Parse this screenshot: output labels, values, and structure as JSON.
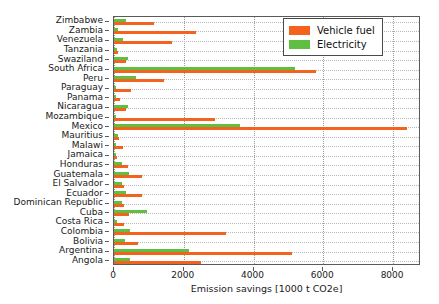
{
  "chart_data": {
    "type": "bar",
    "orientation": "horizontal",
    "title": "",
    "xlabel": "Emission savings [1000 t CO2e]",
    "ylabel": "",
    "xlim": [
      0,
      8800
    ],
    "xticks": [
      0,
      2000,
      4000,
      6000,
      8000
    ],
    "xtick_labels": [
      "0",
      "2000",
      "4000",
      "6000",
      "8000"
    ],
    "grid": true,
    "legend_position": "top-right",
    "categories": [
      "Zimbabwe",
      "Zambia",
      "Venezuela",
      "Tanzania",
      "Swaziland",
      "South Africa",
      "Peru",
      "Paraguay",
      "Panama",
      "Nicaragua",
      "Mozambique",
      "Mexico",
      "Mauritius",
      "Malawi",
      "Jamaica",
      "Honduras",
      "Guatemala",
      "El Salvador",
      "Ecuador",
      "Dominican Republic",
      "Cuba",
      "Costa Rica",
      "Colombia",
      "Bolivia",
      "Argentina",
      "Angola"
    ],
    "series": [
      {
        "name": "Vehicle fuel",
        "color": "#f4631e",
        "values": [
          1150,
          2350,
          1650,
          110,
          330,
          5800,
          1430,
          480,
          180,
          330,
          2900,
          8400,
          140,
          250,
          80,
          400,
          790,
          280,
          800,
          290,
          430,
          300,
          3200,
          680,
          5100,
          2500
        ]
      },
      {
        "name": "Electricity",
        "color": "#5fbf43",
        "values": [
          330,
          120,
          250,
          90,
          390,
          5200,
          640,
          60,
          60,
          390,
          60,
          3600,
          110,
          60,
          70,
          240,
          420,
          220,
          340,
          230,
          960,
          90,
          460,
          310,
          2150,
          450
        ]
      }
    ]
  },
  "legend": {
    "entries": [
      {
        "label": "Vehicle fuel",
        "color": "#f4631e"
      },
      {
        "label": "Electricity",
        "color": "#5fbf43"
      }
    ]
  }
}
